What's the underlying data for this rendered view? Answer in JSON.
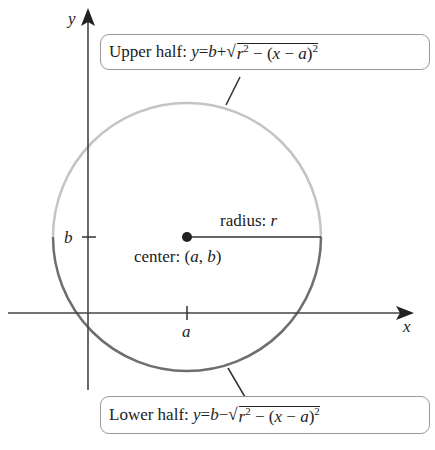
{
  "axes": {
    "x_label": "x",
    "y_label": "y",
    "x_tick_label": "a",
    "y_tick_label": "b"
  },
  "circle": {
    "center_label": "center: (a, b)",
    "center_prefix": "center: ",
    "center_a": "a",
    "center_b": "b",
    "radius_prefix": "radius: ",
    "radius_var": "r",
    "upper_color": "#c4c4c4",
    "lower_color": "#6e6e6e"
  },
  "upper_box": {
    "label": "Upper half: ",
    "y": "y",
    "eq": " = ",
    "b": "b",
    "op": " + ",
    "r": "r",
    "minus": " − (",
    "x": "x",
    "minus2": " − ",
    "a": "a",
    "close": ")"
  },
  "lower_box": {
    "label": "Lower half: ",
    "y": "y",
    "eq": " = ",
    "b": "b",
    "op": " − ",
    "r": "r",
    "minus": " − (",
    "x": "x",
    "minus2": " − ",
    "a": "a",
    "close": ")"
  },
  "exponent": "2"
}
